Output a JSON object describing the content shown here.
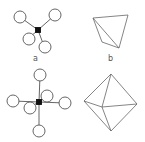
{
  "figure": {
    "panels": [
      {
        "id": "a",
        "label": "a",
        "description": "tetrahedral ball-and-stick model"
      },
      {
        "id": "b",
        "label": "b",
        "description": "tetrahedron polyhedron"
      },
      {
        "id": "c",
        "label": "",
        "description": "octahedral ball-and-stick model"
      },
      {
        "id": "d",
        "label": "",
        "description": "octahedron polyhedron"
      }
    ]
  },
  "colors": {
    "line": "#555555",
    "atom": "#ffffff",
    "center": "#111111"
  }
}
